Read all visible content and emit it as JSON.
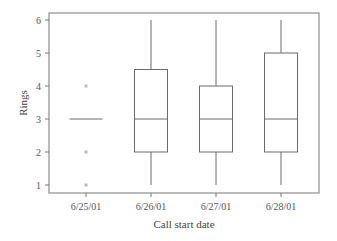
{
  "chart_data": {
    "type": "box",
    "title": "",
    "xlabel": "Call start date",
    "ylabel": "Rings",
    "ylim": [
      1,
      6
    ],
    "yticks": [
      1,
      2,
      3,
      4,
      5,
      6
    ],
    "categories": [
      "6/25/01",
      "6/26/01",
      "6/27/01",
      "6/28/01"
    ],
    "series": [
      {
        "name": "6/25/01",
        "min": 3,
        "q1": 3,
        "median": 3,
        "q3": 3,
        "max": 3,
        "outliers": [
          1,
          2,
          4
        ]
      },
      {
        "name": "6/26/01",
        "min": 1,
        "q1": 2,
        "median": 3,
        "q3": 4.5,
        "max": 6,
        "outliers": []
      },
      {
        "name": "6/27/01",
        "min": 1,
        "q1": 2,
        "median": 3,
        "q3": 4,
        "max": 6,
        "outliers": []
      },
      {
        "name": "6/28/01",
        "min": 1,
        "q1": 2,
        "median": 3,
        "q3": 5,
        "max": 6,
        "outliers": []
      }
    ],
    "grid": false,
    "legend": null
  },
  "colors": {
    "axis": "#777777",
    "box": "#6a6a6a",
    "outlier": "#bbbbbb",
    "text": "#444444"
  }
}
